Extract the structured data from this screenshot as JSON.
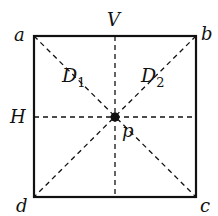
{
  "diagram": {
    "type": "square-symmetry-axes",
    "colors": {
      "stroke": "#111111",
      "background": "#ffffff"
    },
    "vertices": [
      {
        "id": "a",
        "label": "a",
        "x": 34,
        "y": 36
      },
      {
        "id": "b",
        "label": "b",
        "x": 196,
        "y": 36
      },
      {
        "id": "c",
        "label": "c",
        "x": 196,
        "y": 197
      },
      {
        "id": "d",
        "label": "d",
        "x": 34,
        "y": 197
      }
    ],
    "center": {
      "label": "p",
      "x": 115,
      "y": 117
    },
    "axes": {
      "vertical": {
        "label": "V"
      },
      "horizontal": {
        "label": "H"
      },
      "diagonal_1": {
        "label": "D",
        "subscript": "1",
        "from": "a",
        "to": "c"
      },
      "diagonal_2": {
        "label": "D",
        "subscript": "2",
        "from": "b",
        "to": "d"
      }
    }
  }
}
